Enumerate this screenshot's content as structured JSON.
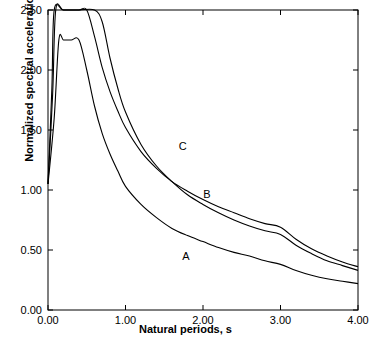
{
  "chart_data": {
    "type": "line",
    "title": "",
    "xlabel": "Natural periods, s",
    "ylabel": "Normalized spectral acceleration, s",
    "ylabel_sub": "e",
    "xlim": [
      0.0,
      4.0
    ],
    "ylim": [
      0.0,
      2.5
    ],
    "xticks": [
      "0.00",
      "1.00",
      "2.00",
      "3.00",
      "4.00"
    ],
    "xtick_values": [
      0.0,
      1.0,
      2.0,
      3.0,
      4.0
    ],
    "yticks": [
      "0.00",
      "0.50",
      "1.00",
      "1.50",
      "2.00",
      "2.50"
    ],
    "ytick_values": [
      0.0,
      0.5,
      1.0,
      1.5,
      2.0,
      2.5
    ],
    "grid": false,
    "legend_position": "inline-labels",
    "series": [
      {
        "name": "A",
        "label": "A",
        "label_x": 1.78,
        "label_y": 0.42,
        "points": [
          [
            0.0,
            1.05
          ],
          [
            0.08,
            1.6
          ],
          [
            0.14,
            2.25
          ],
          [
            0.2,
            2.25
          ],
          [
            0.3,
            2.25
          ],
          [
            0.4,
            2.25
          ],
          [
            0.5,
            2.0
          ],
          [
            0.6,
            1.7
          ],
          [
            0.7,
            1.47
          ],
          [
            0.8,
            1.3
          ],
          [
            0.9,
            1.16
          ],
          [
            1.0,
            1.03
          ],
          [
            1.2,
            0.88
          ],
          [
            1.4,
            0.77
          ],
          [
            1.6,
            0.68
          ],
          [
            1.8,
            0.62
          ],
          [
            2.0,
            0.57
          ],
          [
            2.2,
            0.52
          ],
          [
            2.4,
            0.48
          ],
          [
            2.6,
            0.45
          ],
          [
            2.8,
            0.41
          ],
          [
            3.0,
            0.38
          ],
          [
            3.2,
            0.33
          ],
          [
            3.4,
            0.29
          ],
          [
            3.6,
            0.26
          ],
          [
            3.8,
            0.24
          ],
          [
            4.0,
            0.22
          ]
        ]
      },
      {
        "name": "B",
        "label": "B",
        "label_x": 2.05,
        "label_y": 0.93,
        "points": [
          [
            0.0,
            1.05
          ],
          [
            0.06,
            1.8
          ],
          [
            0.1,
            2.5
          ],
          [
            0.2,
            2.5
          ],
          [
            0.4,
            2.5
          ],
          [
            0.6,
            2.5
          ],
          [
            0.7,
            2.4
          ],
          [
            0.8,
            2.1
          ],
          [
            0.9,
            1.85
          ],
          [
            1.0,
            1.65
          ],
          [
            1.2,
            1.38
          ],
          [
            1.4,
            1.2
          ],
          [
            1.6,
            1.07
          ],
          [
            1.8,
            0.96
          ],
          [
            2.0,
            0.88
          ],
          [
            2.2,
            0.81
          ],
          [
            2.4,
            0.75
          ],
          [
            2.6,
            0.7
          ],
          [
            2.8,
            0.66
          ],
          [
            3.0,
            0.63
          ],
          [
            3.2,
            0.54
          ],
          [
            3.4,
            0.47
          ],
          [
            3.6,
            0.41
          ],
          [
            3.8,
            0.37
          ],
          [
            4.0,
            0.33
          ]
        ]
      },
      {
        "name": "C",
        "label": "C",
        "label_x": 1.74,
        "label_y": 1.33,
        "points": [
          [
            0.0,
            1.05
          ],
          [
            0.05,
            1.85
          ],
          [
            0.08,
            2.5
          ],
          [
            0.2,
            2.5
          ],
          [
            0.4,
            2.5
          ],
          [
            0.5,
            2.5
          ],
          [
            0.6,
            2.28
          ],
          [
            0.7,
            2.02
          ],
          [
            0.8,
            1.82
          ],
          [
            0.9,
            1.66
          ],
          [
            1.0,
            1.52
          ],
          [
            1.2,
            1.32
          ],
          [
            1.4,
            1.18
          ],
          [
            1.6,
            1.07
          ],
          [
            1.8,
            0.99
          ],
          [
            2.0,
            0.92
          ],
          [
            2.2,
            0.86
          ],
          [
            2.4,
            0.81
          ],
          [
            2.6,
            0.76
          ],
          [
            2.8,
            0.72
          ],
          [
            3.0,
            0.69
          ],
          [
            3.2,
            0.59
          ],
          [
            3.4,
            0.51
          ],
          [
            3.6,
            0.45
          ],
          [
            3.8,
            0.4
          ],
          [
            4.0,
            0.36
          ]
        ]
      }
    ]
  }
}
